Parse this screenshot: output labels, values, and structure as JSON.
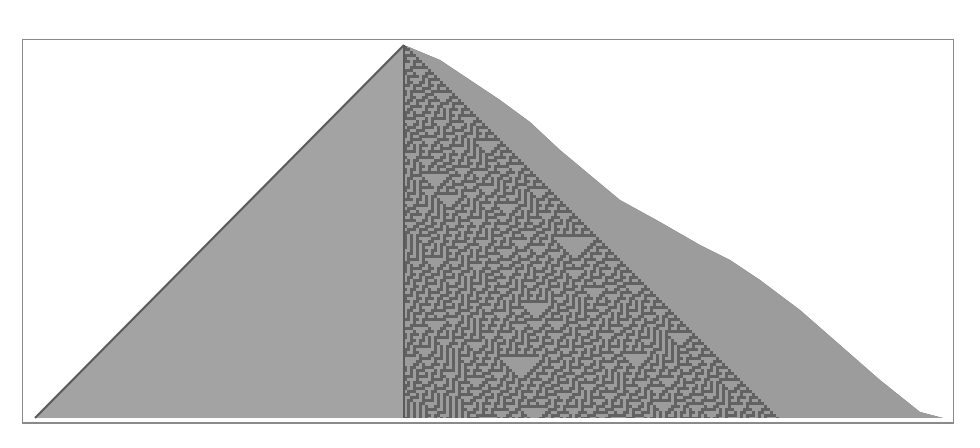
{
  "figure": {
    "rule": 30,
    "colors": {
      "background": "#ffffff",
      "frame": "#8a8a8a",
      "cell_on": "#9c9c9c",
      "cell_off": "#626262",
      "left_fill": "#a3a3a3",
      "edge": "#5a5a5a"
    },
    "apex": [
      404,
      45
    ],
    "left_base": [
      35,
      418
    ],
    "right_boundary": [
      [
        404,
        45
      ],
      [
        440,
        60
      ],
      [
        470,
        80
      ],
      [
        500,
        100
      ],
      [
        530,
        122
      ],
      [
        560,
        150
      ],
      [
        590,
        175
      ],
      [
        620,
        200
      ],
      [
        660,
        222
      ],
      [
        700,
        245
      ],
      [
        730,
        260
      ],
      [
        760,
        280
      ],
      [
        800,
        310
      ],
      [
        840,
        345
      ],
      [
        880,
        380
      ],
      [
        920,
        412
      ],
      [
        943,
        418
      ]
    ]
  }
}
